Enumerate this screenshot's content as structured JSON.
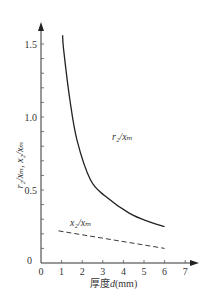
{
  "chart_data": {
    "type": "line",
    "title": "",
    "xlabel": "厚度d(mm)",
    "ylabel": "r2/xm, x2/xm",
    "xlim": [
      0,
      7
    ],
    "ylim": [
      0,
      1.6
    ],
    "x_ticks": [
      "0",
      "1",
      "2",
      "3",
      "4",
      "5",
      "6",
      "7"
    ],
    "y_ticks": [
      "0",
      "0.5",
      "1.0",
      "1.5"
    ],
    "grid": false,
    "legend": null,
    "series": [
      {
        "name": "r2/xm",
        "style": "solid",
        "x": [
          1.05,
          1.1,
          1.4,
          1.75,
          2.4,
          3.1,
          4.3,
          5.3,
          6.0
        ],
        "y": [
          1.56,
          1.46,
          1.12,
          0.84,
          0.57,
          0.46,
          0.34,
          0.28,
          0.25
        ]
      },
      {
        "name": "x2/xm",
        "style": "dashed",
        "x": [
          0.85,
          6.0
        ],
        "y": [
          0.22,
          0.1
        ]
      }
    ],
    "annotations": [
      {
        "text": "r2/xm",
        "x": 3.4,
        "y": 0.85
      },
      {
        "text": "x2/xm",
        "x": 1.4,
        "y": 0.27
      }
    ]
  },
  "labels": {
    "xlabel_prefix": "厚度",
    "xlabel_var": "d",
    "xlabel_unit": "(mm)",
    "ylabel": "r₂/xₘ, x₂/xₘ",
    "ann_r2": "r₂/xₘ",
    "ann_x2": "x₂/xₘ",
    "origin": "0"
  }
}
